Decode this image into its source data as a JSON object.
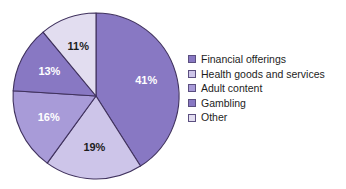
{
  "chart_data": {
    "type": "pie",
    "title": "",
    "categories": [
      "Financial offerings",
      "Health goods and services",
      "Adult content",
      "Gambling",
      "Other"
    ],
    "values": [
      41,
      19,
      16,
      13,
      11
    ],
    "value_labels": [
      "41%",
      "19%",
      "16%",
      "13%",
      "11%"
    ],
    "unit": "%",
    "colors": [
      "#8878c3",
      "#cdc5e9",
      "#a89bd8",
      "#8878c3",
      "#e2ddf0"
    ],
    "label_colors": [
      "#ffffff",
      "#1d1d1d",
      "#ffffff",
      "#ffffff",
      "#1d1d1d"
    ],
    "start_angle_deg": 0,
    "direction": "clockwise",
    "legend_position": "right",
    "grid": false,
    "outline_color": "#40325e"
  },
  "legend": {
    "items": [
      {
        "label": "Financial offerings",
        "color": "#8878c3"
      },
      {
        "label": "Health goods and services",
        "color": "#cdc5e9"
      },
      {
        "label": "Adult content",
        "color": "#a89bd8"
      },
      {
        "label": "Gambling",
        "color": "#8878c3"
      },
      {
        "label": "Other",
        "color": "#e2ddf0"
      }
    ]
  },
  "slices": [
    {
      "label": "41%"
    },
    {
      "label": "19%"
    },
    {
      "label": "16%"
    },
    {
      "label": "13%"
    },
    {
      "label": "11%"
    }
  ]
}
